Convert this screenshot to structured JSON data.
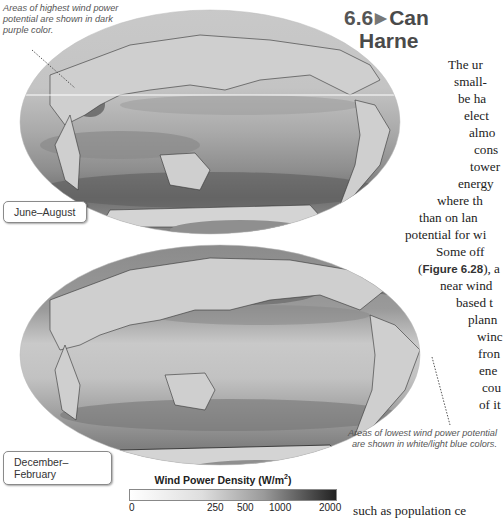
{
  "heading": {
    "section_number": "6.6",
    "arrow_icon": "▶",
    "line1": "Can",
    "line2": "Harne"
  },
  "body_lines": [
    {
      "text": "The ur",
      "left": 448,
      "top": 57
    },
    {
      "text": "small-",
      "left": 454,
      "top": 74
    },
    {
      "text": "be ha",
      "left": 458,
      "top": 91
    },
    {
      "text": "elect",
      "left": 464,
      "top": 108
    },
    {
      "text": "almo",
      "left": 469,
      "top": 125
    },
    {
      "text": "cons",
      "left": 474,
      "top": 142
    },
    {
      "text": "tower",
      "left": 470,
      "top": 159
    },
    {
      "text": "energy",
      "left": 458,
      "top": 176
    },
    {
      "text": "where th",
      "left": 437,
      "top": 193
    },
    {
      "text": "than on lan",
      "left": 419,
      "top": 210
    },
    {
      "text": "potential for wi",
      "left": 405,
      "top": 227
    },
    {
      "text": "Some  off",
      "left": 436,
      "top": 244
    },
    {
      "text": "), a",
      "left": 480,
      "top": 261,
      "prefix": "(",
      "fig_ref": "Figure 6.28"
    },
    {
      "text": "near wind",
      "left": 440,
      "top": 278
    },
    {
      "text": "based t",
      "left": 456,
      "top": 295
    },
    {
      "text": "plann",
      "left": 468,
      "top": 312
    },
    {
      "text": "winc",
      "left": 477,
      "top": 329
    },
    {
      "text": "fron",
      "left": 478,
      "top": 346
    },
    {
      "text": "ene",
      "left": 479,
      "top": 363
    },
    {
      "text": "cou",
      "left": 482,
      "top": 380
    },
    {
      "text": "of it",
      "left": 479,
      "top": 397
    },
    {
      "text": "such as population ce",
      "left": 353,
      "top": 503
    }
  ],
  "callouts": {
    "top": "Areas of highest wind power potential are shown in dark purple color.",
    "bottom": "Areas of lowest wind power potential are shown in white/light blue colors."
  },
  "maps": {
    "top_season": "June–August",
    "bottom_season": "December–February"
  },
  "legend": {
    "title": "Wind Power Density (W/m",
    "title_sup": "2",
    "title_end": ")",
    "ticks": [
      {
        "label": "0",
        "pos": 0
      },
      {
        "label": "250",
        "pos": 78
      },
      {
        "label": "500",
        "pos": 108
      },
      {
        "label": "1000",
        "pos": 140
      },
      {
        "label": "2000",
        "pos": 190
      }
    ]
  }
}
